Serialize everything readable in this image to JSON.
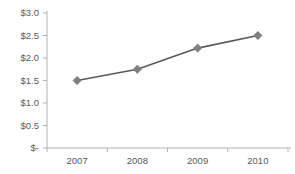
{
  "chart_data": {
    "type": "line",
    "title": "",
    "subtitle": "",
    "xlabel": "",
    "ylabel": "",
    "categories": [
      "2007",
      "2008",
      "2009",
      "2010"
    ],
    "values": [
      1.5,
      1.75,
      2.22,
      2.5
    ],
    "series": [
      {
        "name": "",
        "values": [
          1.5,
          1.75,
          2.22,
          2.5
        ]
      }
    ],
    "ylim": [
      0,
      3.0
    ],
    "ytick_values": [
      0,
      0.5,
      1.0,
      1.5,
      2.0,
      2.5,
      3.0
    ],
    "ytick_labels": [
      "$-",
      "$0.5",
      "$1.0",
      "$1.5",
      "$2.0",
      "$2.5",
      "$3.0"
    ],
    "xtick_labels": [
      "2007",
      "2008",
      "2009",
      "2010"
    ],
    "grid": false,
    "legend": false,
    "legend_position": "none",
    "annotations": [],
    "colors": {
      "line": "#595959",
      "marker": "#808080",
      "axis": "#b3b3b3",
      "tick_text": "#595959",
      "background": "#ffffff"
    },
    "marker_shape": "diamond"
  }
}
